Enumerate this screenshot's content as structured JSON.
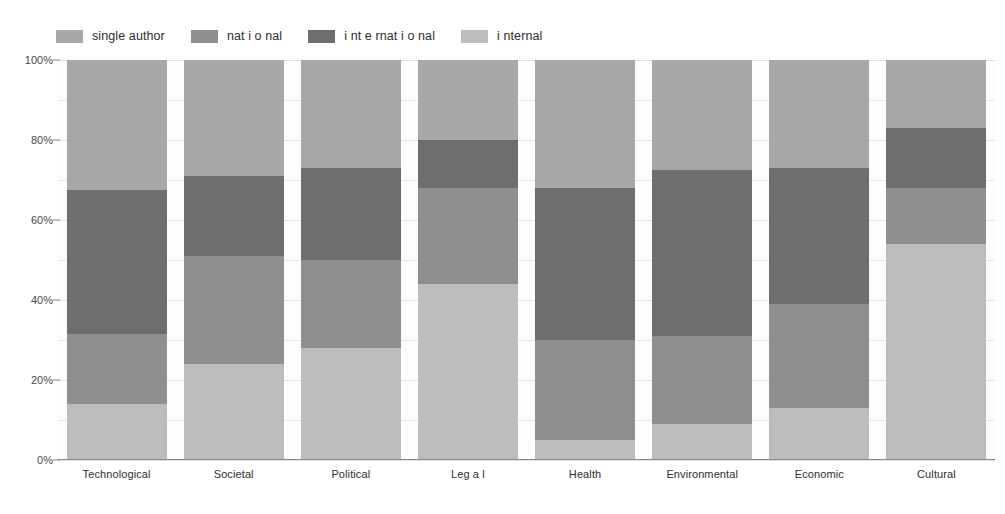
{
  "legend": {
    "position": "top-left",
    "items": [
      {
        "label": "single author",
        "color": "#a8a8a8",
        "key": "single_author"
      },
      {
        "label": "nat i o nal",
        "color": "#8f8f8f",
        "key": "national"
      },
      {
        "label": "i nt e rnat i o nal",
        "color": "#6e6e6e",
        "key": "international"
      },
      {
        "label": "i nternal",
        "color": "#bdbdbd",
        "key": "internal"
      }
    ]
  },
  "axes": {
    "y": {
      "ticks": [
        "0%",
        "20%",
        "40%",
        "60%",
        "80%",
        "100%"
      ],
      "values": [
        0,
        20,
        40,
        60,
        80,
        100
      ],
      "min": 0,
      "max": 100,
      "minor_step": 10,
      "grid": true
    },
    "x": {
      "categories": [
        "Technological",
        "Societal",
        "Political",
        "Leg a l",
        "Health",
        "Environmental",
        "Economic",
        "Cultural"
      ]
    }
  },
  "colors": {
    "single_author": "#a8a8a8",
    "national": "#8f8f8f",
    "international": "#6e6e6e",
    "internal": "#bdbdbd",
    "gridline": "#e9e9e9",
    "axis": "#8a8a8a",
    "background": "#ffffff",
    "plot_background": "#fdfdfd",
    "text": "#2e2e2e"
  },
  "chart_data": {
    "type": "bar",
    "subtype": "stacked-100-percent",
    "title": "",
    "xlabel": "",
    "ylabel": "",
    "ylim": [
      0,
      100
    ],
    "grid": true,
    "legend_position": "top-left",
    "categories": [
      "Technological",
      "Societal",
      "Political",
      "Leg a l",
      "Health",
      "Environmental",
      "Economic",
      "Cultural"
    ],
    "series": [
      {
        "name": "i nternal",
        "key": "internal",
        "color": "#bdbdbd",
        "values": [
          14,
          24,
          28,
          44,
          5,
          9,
          13,
          54
        ]
      },
      {
        "name": "nat i o nal",
        "key": "national",
        "color": "#8f8f8f",
        "values": [
          17.5,
          27,
          22,
          24,
          25,
          22,
          26,
          14
        ]
      },
      {
        "name": "i nt e rnat i o nal",
        "key": "international",
        "color": "#6e6e6e",
        "values": [
          36,
          20,
          23,
          12,
          38,
          41.5,
          34,
          15
        ]
      },
      {
        "name": "single author",
        "key": "single_author",
        "color": "#a8a8a8",
        "values": [
          32.5,
          29,
          27,
          20,
          32,
          27.5,
          27,
          17
        ]
      }
    ],
    "stack_order_bottom_to_top": [
      "i nternal",
      "nat i o nal",
      "i nt e rnat i o nal",
      "single author"
    ],
    "cumulative_boundaries_percent": [
      {
        "category": "Technological",
        "boundaries": [
          0,
          14,
          31.5,
          67.5,
          100
        ]
      },
      {
        "category": "Societal",
        "boundaries": [
          0,
          24,
          51,
          71,
          100
        ]
      },
      {
        "category": "Political",
        "boundaries": [
          0,
          28,
          50,
          73,
          100
        ]
      },
      {
        "category": "Leg a l",
        "boundaries": [
          0,
          44,
          68,
          80,
          100
        ]
      },
      {
        "category": "Health",
        "boundaries": [
          0,
          5,
          30,
          68,
          100
        ]
      },
      {
        "category": "Environmental",
        "boundaries": [
          0,
          9,
          31,
          72.5,
          100
        ]
      },
      {
        "category": "Economic",
        "boundaries": [
          0,
          13,
          39,
          73,
          100
        ]
      },
      {
        "category": "Cultural",
        "boundaries": [
          0,
          54,
          68,
          83,
          100
        ]
      }
    ]
  }
}
